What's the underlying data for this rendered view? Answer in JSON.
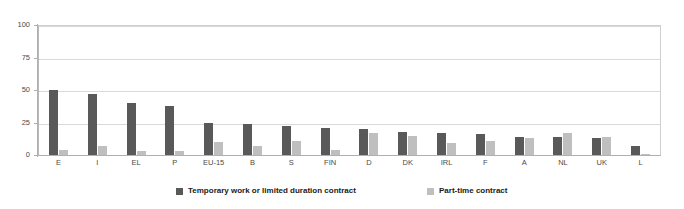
{
  "chart_data": {
    "type": "bar",
    "title": "",
    "subtitle": "",
    "xlabel": "",
    "ylabel": "",
    "ylim": [
      0,
      100
    ],
    "yticks": [
      0,
      25,
      50,
      75,
      100
    ],
    "grid": true,
    "legend_position": "bottom",
    "categories": [
      "E",
      "I",
      "EL",
      "P",
      "EU-15",
      "B",
      "S",
      "FIN",
      "D",
      "DK",
      "IRL",
      "F",
      "A",
      "NL",
      "UK",
      "L"
    ],
    "series": [
      {
        "name": "Temporary work or limited duration contract",
        "color": "#595959",
        "values": [
          50,
          47,
          40,
          38,
          25,
          24,
          22,
          21,
          20,
          18,
          17,
          16,
          14,
          14,
          13,
          7
        ]
      },
      {
        "name": "Part-time contract",
        "color": "#bfbfbf",
        "values": [
          4,
          7,
          3,
          3,
          10,
          7,
          11,
          4,
          17,
          15,
          9,
          11,
          13,
          17,
          14,
          1
        ]
      }
    ]
  },
  "legend": {
    "items": [
      {
        "label": "Temporary work or limited duration contract"
      },
      {
        "label": "Part-time contract"
      }
    ]
  }
}
